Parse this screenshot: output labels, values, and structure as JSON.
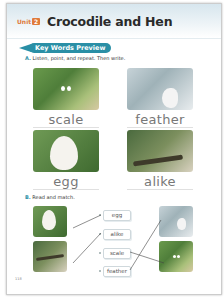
{
  "header": {
    "unit_label": "Unit",
    "unit_number": "2",
    "title": "Crocodile and Hen"
  },
  "section_banner": {
    "label": "Key Words Preview"
  },
  "part_a": {
    "letter": "A.",
    "instruction": "Listen, point, and repeat. Then write.",
    "items": [
      {
        "word": "scale",
        "image": "crocodile-scales-image"
      },
      {
        "word": "feather",
        "image": "hen-feather-image"
      },
      {
        "word": "egg",
        "image": "egg-in-nest-image"
      },
      {
        "word": "alike",
        "image": "crocodile-and-hen-alike-image"
      }
    ]
  },
  "part_b": {
    "letter": "B.",
    "instruction": "Read and match.",
    "words": [
      "egg",
      "alike",
      "scale",
      "feather"
    ],
    "left_images": [
      "egg-in-nest-image",
      "crocodile-and-hen-alike-image"
    ],
    "right_images": [
      "hen-feather-image",
      "crocodile-scales-image"
    ]
  },
  "page_number": "118",
  "colors": {
    "accent_teal": "#2a8fa6",
    "unit_orange": "#e07a3a",
    "word_gray": "#777777"
  }
}
